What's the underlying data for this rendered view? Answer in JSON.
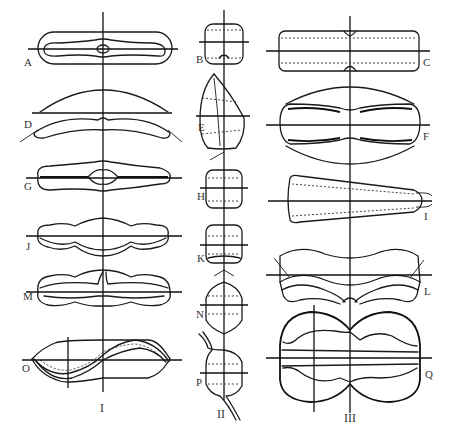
{
  "figure": {
    "columns": [
      {
        "numeral": "I",
        "figures": [
          "A",
          "D",
          "G",
          "J",
          "M",
          "O"
        ]
      },
      {
        "numeral": "II",
        "figures": [
          "B",
          "E",
          "H",
          "K",
          "N",
          "P"
        ]
      },
      {
        "numeral": "III",
        "figures": [
          "C",
          "F",
          "I",
          "L",
          "Q"
        ]
      }
    ],
    "labels": {
      "A": "A",
      "B": "B",
      "C": "C",
      "D": "D",
      "E": "E",
      "F": "F",
      "G": "G",
      "H": "H",
      "I": "I",
      "J": "J",
      "K": "K",
      "L": "L",
      "M": "M",
      "N": "N",
      "O": "O",
      "P": "P",
      "Q": "Q"
    },
    "numerals": {
      "col1": "I",
      "col2": "II",
      "col3": "III"
    },
    "ink_color": "#1a1a1a",
    "background": "#ffffff"
  }
}
